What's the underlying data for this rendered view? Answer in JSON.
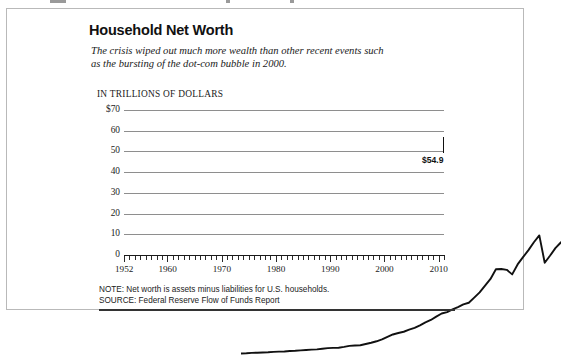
{
  "card": {
    "title": "Household Net Worth",
    "subtitle": "The crisis wiped out much more wealth than other recent events such as the bursting of the dot-com bubble in 2000.",
    "note": "NOTE: Net worth is assets minus liabilities for U.S. households.",
    "source": "SOURCE: Federal Reserve Flow of Funds Report",
    "colors": {
      "line": "#111111",
      "gridline": "#8e8e8e",
      "border": "#b9b9b9",
      "background": "#ffffff",
      "text": "#1a1a1a"
    }
  },
  "chart_data": {
    "type": "line",
    "title": "Household Net Worth",
    "subtitle": "The crisis wiped out much more wealth than other recent events such as the bursting of the dot-com bubble in 2000.",
    "xlabel": "",
    "ylabel": "IN TRILLIONS OF DOLLARS",
    "ylim": [
      0,
      70
    ],
    "xlim": [
      1952,
      2011
    ],
    "grid": true,
    "legend": null,
    "yticks": [
      0,
      10,
      20,
      30,
      40,
      50,
      60,
      70
    ],
    "ytick_labels": [
      "0",
      "10",
      "20",
      "30",
      "40",
      "50",
      "60",
      "$70"
    ],
    "xticks": [
      1952,
      1960,
      1970,
      1980,
      1990,
      2000,
      2010
    ],
    "xtick_labels": [
      "1952",
      "1960",
      "1970",
      "1980",
      "1990",
      "2000",
      "2010"
    ],
    "minor_xtick_interval": 1,
    "annotations": [
      {
        "label": "$54.9",
        "x": 2011,
        "y": 54.9,
        "bold": true
      }
    ],
    "series": [
      {
        "name": "Household net worth",
        "x": [
          1952,
          1953,
          1954,
          1955,
          1956,
          1957,
          1958,
          1959,
          1960,
          1961,
          1962,
          1963,
          1964,
          1965,
          1966,
          1967,
          1968,
          1969,
          1970,
          1971,
          1972,
          1973,
          1974,
          1975,
          1976,
          1977,
          1978,
          1979,
          1980,
          1981,
          1982,
          1983,
          1984,
          1985,
          1986,
          1987,
          1988,
          1989,
          1990,
          1991,
          1992,
          1993,
          1994,
          1995,
          1996,
          1997,
          1998,
          1999,
          2000,
          2001,
          2002,
          2003,
          2004,
          2005,
          2006,
          2007,
          2008,
          2009,
          2010,
          2011
        ],
        "values": [
          1.2,
          1.3,
          1.5,
          1.6,
          1.7,
          1.8,
          2.0,
          2.1,
          2.2,
          2.4,
          2.5,
          2.7,
          2.9,
          3.1,
          3.2,
          3.5,
          3.8,
          3.9,
          4.0,
          4.4,
          4.9,
          5.1,
          5.2,
          5.8,
          6.4,
          7.1,
          8.0,
          9.2,
          10.4,
          11.1,
          11.7,
          12.7,
          13.6,
          14.8,
          16.2,
          17.4,
          19.0,
          20.5,
          21.2,
          22.5,
          23.6,
          24.9,
          25.7,
          28.2,
          30.7,
          34.0,
          37.2,
          41.9,
          42.0,
          41.6,
          39.4,
          44.2,
          47.7,
          51.1,
          54.9,
          58.2,
          45.0,
          48.5,
          52.2,
          54.9
        ],
        "units": "trillions of dollars"
      }
    ]
  }
}
